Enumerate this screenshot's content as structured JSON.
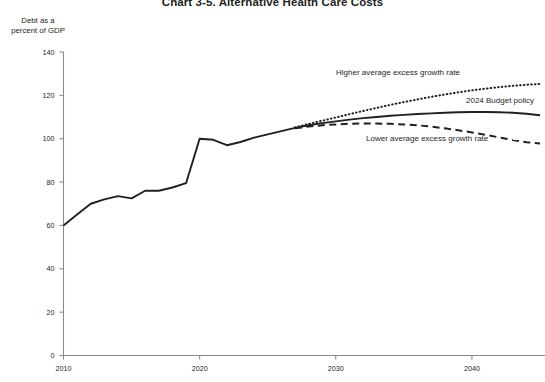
{
  "chart_data": {
    "type": "line",
    "title": "Chart 3-5. Alternative Health Care Costs",
    "ylabel_line1": "Debt as a",
    "ylabel_line2": "percent of GDP",
    "xlabel": "",
    "grid": false,
    "legend_position": "inline-annotations",
    "xlim": [
      2010,
      2045
    ],
    "ylim": [
      0,
      140
    ],
    "yticks": [
      0,
      20,
      40,
      60,
      80,
      100,
      120,
      140
    ],
    "xticks": [
      2010,
      2020,
      2030,
      2040
    ],
    "series": [
      {
        "name": "2024 Budget policy",
        "style": "solid",
        "color": "#231f20",
        "x": [
          2010,
          2011,
          2012,
          2013,
          2014,
          2015,
          2016,
          2017,
          2018,
          2019,
          2020,
          2021,
          2022,
          2023,
          2024,
          2025,
          2026,
          2027,
          2028,
          2029,
          2030,
          2031,
          2032,
          2033,
          2034,
          2035,
          2036,
          2037,
          2038,
          2039,
          2040,
          2041,
          2042,
          2043,
          2044,
          2045
        ],
        "values": [
          60.0,
          65.0,
          70.0,
          72.0,
          73.5,
          72.5,
          76.0,
          76.0,
          77.5,
          79.5,
          100.0,
          99.5,
          97.0,
          98.5,
          100.5,
          102.0,
          103.5,
          105.0,
          106.2,
          107.2,
          108.0,
          108.8,
          109.5,
          110.0,
          110.6,
          111.0,
          111.4,
          111.7,
          112.0,
          112.2,
          112.3,
          112.3,
          112.2,
          112.0,
          111.5,
          110.8
        ]
      },
      {
        "name": "Higher average excess growth rate",
        "style": "dotted",
        "color": "#231f20",
        "x": [
          2027,
          2028,
          2029,
          2030,
          2031,
          2032,
          2033,
          2034,
          2035,
          2036,
          2037,
          2038,
          2039,
          2040,
          2041,
          2042,
          2043,
          2044,
          2045
        ],
        "values": [
          105.2,
          106.8,
          108.3,
          109.8,
          111.3,
          112.8,
          114.2,
          115.6,
          116.9,
          118.1,
          119.3,
          120.4,
          121.4,
          122.3,
          123.1,
          123.8,
          124.4,
          124.9,
          125.3
        ]
      },
      {
        "name": "Lower average excess growth rate",
        "style": "dashed",
        "color": "#231f20",
        "x": [
          2027,
          2028,
          2029,
          2030,
          2031,
          2032,
          2033,
          2034,
          2035,
          2036,
          2037,
          2038,
          2039,
          2040,
          2041,
          2042,
          2043,
          2044,
          2045
        ],
        "values": [
          104.8,
          105.6,
          106.2,
          106.6,
          106.9,
          107.0,
          107.0,
          106.9,
          106.6,
          106.2,
          105.6,
          104.8,
          103.9,
          102.9,
          101.8,
          100.6,
          99.4,
          98.4,
          97.8
        ]
      }
    ],
    "annotations": [
      {
        "text": "Higher average excess growth rate",
        "x": 336,
        "y": 68
      },
      {
        "text": "2024 Budget policy",
        "x": 466,
        "y": 96
      },
      {
        "text": "Lower average excess growth rate",
        "x": 366,
        "y": 134
      }
    ]
  }
}
